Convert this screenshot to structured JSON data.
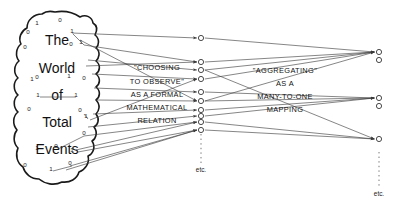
{
  "figure": {
    "background_color": "#ffffff",
    "ink_color": "#111111",
    "width": 403,
    "height": 209
  },
  "blob": {
    "title_lines": [
      "The",
      "World",
      "of",
      "Total",
      "Events"
    ],
    "bits": [
      {
        "v": "1",
        "x": 37,
        "y": 25
      },
      {
        "v": "0",
        "x": 60,
        "y": 22
      },
      {
        "v": "0",
        "x": 28,
        "y": 34
      },
      {
        "v": "1",
        "x": 72,
        "y": 33
      },
      {
        "v": "0",
        "x": 25,
        "y": 49
      },
      {
        "v": "0",
        "x": 71,
        "y": 46
      },
      {
        "v": "1",
        "x": 81,
        "y": 44
      },
      {
        "v": "0",
        "x": 37,
        "y": 79
      },
      {
        "v": "1",
        "x": 32,
        "y": 81
      },
      {
        "v": "1",
        "x": 69,
        "y": 78
      },
      {
        "v": "0",
        "x": 84,
        "y": 80
      },
      {
        "v": "1",
        "x": 38,
        "y": 97
      },
      {
        "v": "1",
        "x": 76,
        "y": 97
      },
      {
        "v": "0",
        "x": 29,
        "y": 111
      },
      {
        "v": "0",
        "x": 80,
        "y": 112
      },
      {
        "v": "1",
        "x": 86,
        "y": 118
      },
      {
        "v": "0",
        "x": 84,
        "y": 135
      },
      {
        "v": "1",
        "x": 37,
        "y": 150
      },
      {
        "v": "0",
        "x": 56,
        "y": 148
      },
      {
        "v": "1",
        "x": 72,
        "y": 152
      },
      {
        "v": "0",
        "x": 25,
        "y": 167
      },
      {
        "v": "1",
        "x": 51,
        "y": 171
      },
      {
        "v": "0",
        "x": 70,
        "y": 165
      }
    ]
  },
  "captions": {
    "middle": {
      "lines": [
        "\"CHOOSING",
        "TO OBSERVE\"",
        "AS A FORMAL",
        "MATHEMATICAL",
        "RELATION"
      ]
    },
    "right": {
      "lines": [
        "\"AGGREGATING\"",
        "AS A",
        "MANY-TO-ONE",
        "MAPPING"
      ]
    }
  },
  "columns": {
    "middle": {
      "x": 201,
      "node_radius": 2.6,
      "nodes_y": [
        38,
        62,
        70,
        79,
        92,
        101,
        110,
        116,
        122,
        130
      ],
      "etc_label": "etc.",
      "etc_x": 201,
      "etc_y": 172,
      "dotline": {
        "x": 201,
        "y1": 134,
        "y2": 164
      }
    },
    "right": {
      "x": 379,
      "node_radius": 2.6,
      "nodes_y": [
        52,
        60,
        98,
        106,
        139
      ],
      "etc_label": "etc.",
      "etc_x": 379,
      "etc_y": 196,
      "dotline": {
        "x": 379,
        "y1": 152,
        "y2": 188
      }
    }
  },
  "edges": {
    "left_to_middle_count": 11,
    "middle_to_right_count": 12
  }
}
